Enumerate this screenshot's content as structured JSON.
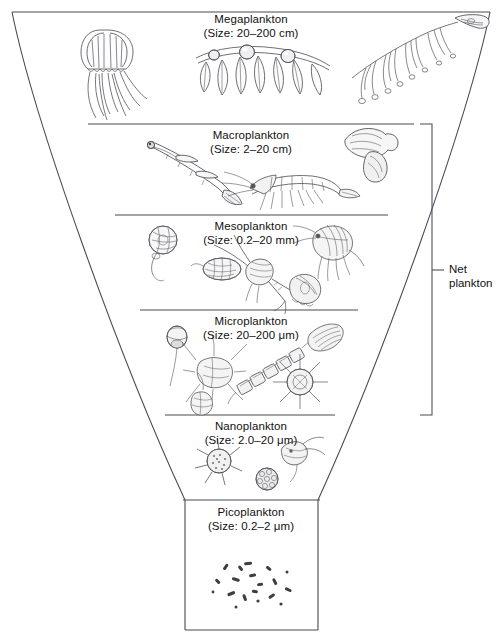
{
  "figure": {
    "line_color": "#4a4a52",
    "ink_color": "#55555c",
    "background": "#ffffff"
  },
  "bands": [
    {
      "id": "megaplankton",
      "name": "Megaplankton",
      "size": "(Size: 20–200 cm)",
      "organisms": [
        "jellyfish",
        "salp-chain",
        "siphonophore",
        "floating-seaweed"
      ]
    },
    {
      "id": "macroplankton",
      "name": "Macroplankton",
      "size": "(Size: 2–20 cm)",
      "organisms": [
        "arrow-worm",
        "krill",
        "pteropod"
      ]
    },
    {
      "id": "mesoplankton",
      "name": "Mesoplankton",
      "size": "(Size: 0.2–20 mm)",
      "organisms": [
        "veliger-larva",
        "crab-zoea",
        "copepod",
        "amphipod",
        "ostracod"
      ]
    },
    {
      "id": "microplankton",
      "name": "Microplankton",
      "size": "(Size: 20–200 μm)",
      "organisms": [
        "tintinnid",
        "ceratium-dinoflagellate",
        "chain-diatom",
        "radiolarian",
        "centric-diatom"
      ]
    },
    {
      "id": "nanoplankton",
      "name": "Nanoplankton",
      "size": "(Size: 2.0–20 μm)",
      "organisms": [
        "silicoflagellate",
        "coccolithophore",
        "flagellate"
      ]
    },
    {
      "id": "picoplankton",
      "name": "Picoplankton",
      "size": "(Size: 0.2–2 μm)",
      "organisms": [
        "bacteria"
      ]
    }
  ],
  "bracket": {
    "line1": "Net",
    "line2": "plankton",
    "spans": [
      "macroplankton",
      "mesoplankton",
      "microplankton"
    ]
  }
}
